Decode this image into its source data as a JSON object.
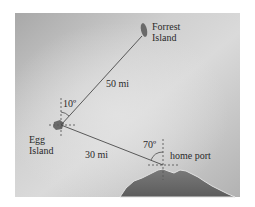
{
  "diagram": {
    "type": "navigation-bearing-map",
    "locations": [
      {
        "name": "Forrest Island",
        "line1": "Forrest",
        "line2": "Island"
      },
      {
        "name": "Egg Island",
        "line1": "Egg",
        "line2": "Island"
      },
      {
        "name": "home port",
        "label": "home port"
      }
    ],
    "segments": [
      {
        "from": "Egg Island",
        "to": "Forrest Island",
        "distance_label": "50 mi"
      },
      {
        "from": "home port",
        "to": "Egg Island",
        "distance_label": "30 mi"
      }
    ],
    "angles": [
      {
        "at": "Egg Island",
        "label": "10º",
        "description": "angle between north and the path to Forrest Island"
      },
      {
        "at": "home port",
        "label": "70º",
        "description": "angle between north and the path to Egg Island"
      }
    ],
    "colors": {
      "background_light": "#d6d6d6",
      "background_dark": "#9a9a9a",
      "land": "#6e6e6e",
      "line": "#4a4a4a",
      "text": "#2a2a2a"
    }
  }
}
